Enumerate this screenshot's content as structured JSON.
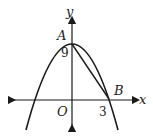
{
  "diagram": {
    "type": "coordinate-graph",
    "axes": {
      "x_label": "x",
      "y_label": "y",
      "origin_label": "O"
    },
    "points": [
      {
        "name": "A",
        "coords": [
          0,
          9
        ],
        "label": "A"
      },
      {
        "name": "B",
        "coords": [
          3,
          0
        ],
        "label": "B"
      }
    ],
    "tick_labels": {
      "y_intercept": "9",
      "x_intercept": "3"
    },
    "curves": [
      {
        "type": "parabola",
        "description": "downward-opening parabola with vertex at A(0,9), passing through B(3,0) and (-3,0)"
      },
      {
        "type": "segment",
        "from": "A",
        "to": "B"
      }
    ],
    "colors": {
      "stroke": "#1a1a1a",
      "background": "#ffffff"
    }
  }
}
